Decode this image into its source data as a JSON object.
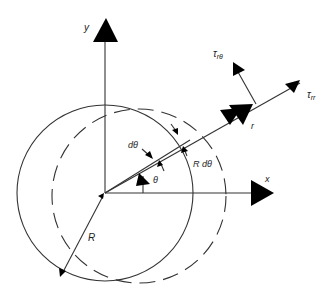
{
  "diagram": {
    "type": "polar-coordinate rotating cylinder / shear stress diagram",
    "labels": {
      "y_axis": "y",
      "x_axis": "x",
      "r": "r",
      "theta": "θ",
      "d_theta": "dθ",
      "arc_length": "R dθ",
      "radius": "R",
      "tau_r_theta": "τ",
      "tau_r_theta_sub": "rθ",
      "tau_rr": "τ",
      "tau_rr_sub": "rr"
    },
    "elements": {
      "solid_circle": {
        "style": "solid",
        "meaning": "original position"
      },
      "dashed_circle": {
        "style": "dashed",
        "meaning": "displaced position"
      }
    },
    "colors": {
      "line": "#333333",
      "arrowhead": "#000000",
      "background": "#ffffff"
    }
  }
}
